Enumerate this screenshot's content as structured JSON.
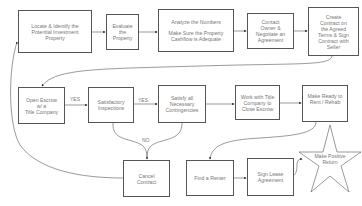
{
  "title": "Process Flowchart",
  "nodes": {
    "locate": {
      "lines": [
        "Locate & Identify the",
        "Potential Investment",
        "Property"
      ]
    },
    "evaluate": {
      "lines": [
        "Evaluate",
        "the",
        "Property"
      ]
    },
    "analyze": {
      "line1": "Analyze the Numbers",
      "line2": "Make Sure the Property",
      "line3": "Cashflow is Adequate"
    },
    "contact": {
      "lines": [
        "Contact",
        "Owner &",
        "Negotiate an",
        "Agreement"
      ]
    },
    "create": {
      "lines": [
        "Create",
        "Contract on",
        "the Agreed",
        "Terms & Sign",
        "Contract with",
        "Seller"
      ]
    },
    "escrow": {
      "lines": [
        "Open Escrow",
        "w/ a",
        "Title Company"
      ]
    },
    "inspections": {
      "lines": [
        "Satisfactory",
        "Inspections"
      ]
    },
    "contingencies": {
      "lines": [
        "Satisfy all",
        "Necessary",
        "Contingencies"
      ]
    },
    "work": {
      "lines": [
        "Work with Title",
        "Company to",
        "Close Escrow"
      ]
    },
    "ready": {
      "lines": [
        "Make Ready to",
        "Rent / Rehab"
      ]
    },
    "cancel": {
      "lines": [
        "Cancel",
        "Contract"
      ]
    },
    "renter": {
      "lines": [
        "Find a Renter"
      ]
    },
    "lease": {
      "lines": [
        "Sign Lease",
        "Agreement"
      ]
    },
    "return": {
      "lines": [
        "Make Positive",
        "Return"
      ]
    }
  },
  "edge_labels": {
    "yes1": "YES",
    "yes2": "YES",
    "no": "NO"
  },
  "colors": {
    "stroke": "#555555",
    "text": "#777777",
    "background": "#ffffff"
  }
}
